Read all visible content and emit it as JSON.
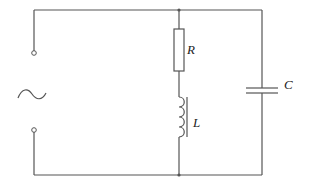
{
  "diagram": {
    "type": "circuit",
    "title": "",
    "components": [
      {
        "id": "source",
        "kind": "ac-source",
        "symbol": "~",
        "label": ""
      },
      {
        "id": "R",
        "kind": "resistor",
        "label": "R"
      },
      {
        "id": "L",
        "kind": "inductor",
        "label": "L"
      },
      {
        "id": "C",
        "kind": "capacitor",
        "label": "C"
      }
    ],
    "topology": "AC source in parallel with (R in series with L) and in parallel with C",
    "labels": {
      "resistor": "R",
      "inductor": "L",
      "capacitor": "C"
    },
    "colors": {
      "wire": "#555555",
      "background": "#ffffff"
    }
  }
}
